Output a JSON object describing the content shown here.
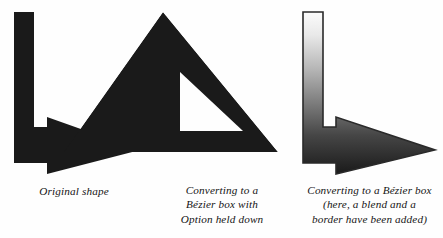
{
  "figure": {
    "background_color": "#fefefe",
    "ink_color": "#1a1a1a",
    "panel_count": 3
  },
  "panels": [
    {
      "id": "panel-original",
      "shape_name": "l-shaped-arrow",
      "fill": "solid-black",
      "fill_color": "#1a1a1a",
      "has_border": false,
      "has_blend": false,
      "has_hole": false,
      "caption_lines": [
        "Original shape"
      ]
    },
    {
      "id": "panel-option-held-down",
      "shape_name": "right-triangle-with-triangular-hole",
      "fill": "solid-black",
      "fill_color": "#1a1a1a",
      "has_border": false,
      "has_blend": false,
      "has_hole": true,
      "caption_lines": [
        "Converting to a",
        "Bézier box with",
        "Option held down"
      ]
    },
    {
      "id": "panel-blend-and-border",
      "shape_name": "l-shaped-arrow",
      "fill": "vertical-blend",
      "blend_start_color": "#fbfbfb",
      "blend_end_color": "#1a1a1a",
      "border_color": "#2a2a2a",
      "has_border": true,
      "has_blend": true,
      "has_hole": false,
      "caption_lines": [
        "Converting to a Bézier box",
        "(here, a blend and a",
        "border have been added)"
      ]
    }
  ],
  "geometry": {
    "arrow_path": "M14,12 L34,12 L34,127 L47,127 L47,117 L140,150 L47,174 L47,163 L14,163 Z",
    "triangle_outer_path": "M163,12 L278,152 L64,152 Z",
    "triangle_hole_path": "M180,72 L243,131 L180,131 Z",
    "arrow_path_right": "M303,12 L323,12 L323,127 L336,127 L336,117 L435,150 L336,174 L336,163 L303,163 Z"
  }
}
